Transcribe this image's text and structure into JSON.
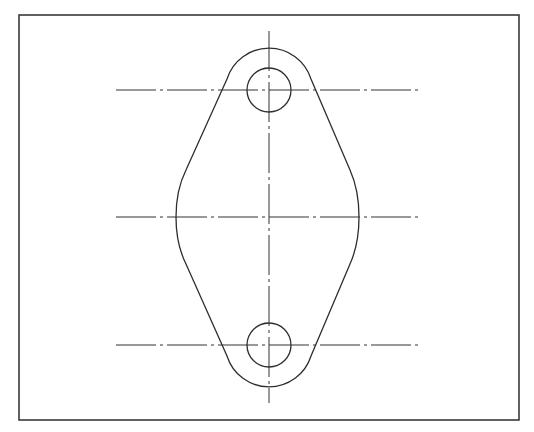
{
  "drawing": {
    "type": "technical-drawing",
    "subject": "diamond-shaped flange plate with two holes",
    "colors": {
      "background": "#ffffff",
      "line": "#2e2e2e",
      "frame": "#3a3a3a"
    },
    "frame": {
      "x": 19,
      "y": 15,
      "width": 500,
      "height": 405
    },
    "vertical_centerline": {
      "x": 269,
      "y1": 31,
      "y2": 403
    },
    "horizontal_centerlines": [
      {
        "y": 90,
        "x1": 116,
        "x2": 421
      },
      {
        "y": 217,
        "x1": 116,
        "x2": 421
      },
      {
        "y": 345,
        "x1": 116,
        "x2": 421
      }
    ],
    "holes": [
      {
        "cx": 269,
        "cy": 90,
        "r": 22
      },
      {
        "cx": 269,
        "cy": 345,
        "r": 22
      }
    ],
    "outline": {
      "top_arc": {
        "cx": 269,
        "cy": 90,
        "r": 44
      },
      "bottom_arc": {
        "cx": 269,
        "cy": 345,
        "r": 44
      },
      "side_extents": {
        "left_x": 176,
        "right_x": 359,
        "y": 217
      }
    }
  }
}
